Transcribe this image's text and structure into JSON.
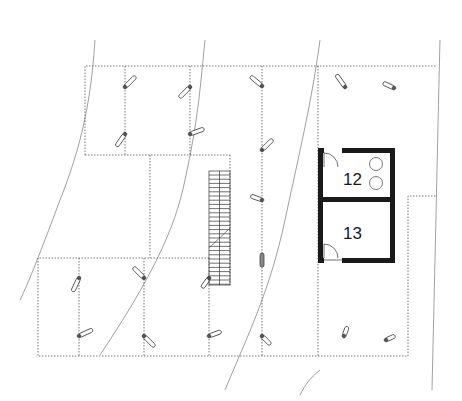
{
  "diagram": {
    "type": "architectural floor plan",
    "rooms": [
      {
        "id": "12",
        "label": "12",
        "fixtures": [
          "two circular fixtures"
        ]
      },
      {
        "id": "13",
        "label": "13"
      }
    ],
    "colors": {
      "wall": "#1a1a1a",
      "dotted_lines": "#555555",
      "contour_lines": "#777777",
      "background": "#ffffff"
    }
  }
}
